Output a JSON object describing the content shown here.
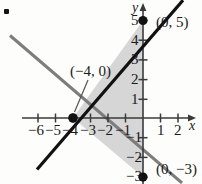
{
  "figure": {
    "kind": "coordinate-plane-graph",
    "background_color": "#fdfdfc",
    "bullet_marker": {
      "present": true,
      "x": 5,
      "y": 9
    }
  },
  "axes": {
    "x_axis_label": "x",
    "y_axis_label": "y",
    "origin_px": {
      "x": 143,
      "y": 118
    },
    "unit_px": {
      "x": 17.5,
      "y": 19.7
    },
    "x_range": [
      -7.6,
      3.2
    ],
    "y_range": [
      -3.4,
      5.9
    ],
    "x_tick_labels": [
      "−6",
      "−5",
      "−4",
      "−3",
      "−2",
      "−1",
      "1",
      "2"
    ],
    "x_tick_values": [
      -6,
      -5,
      -4,
      -3,
      -2,
      -1,
      1,
      2
    ],
    "y_tick_labels": [
      "5",
      "4",
      "3",
      "2",
      "1",
      "−1",
      "−2",
      "−3"
    ],
    "y_tick_values": [
      5,
      4,
      3,
      2,
      1,
      -1,
      -2,
      -3
    ],
    "axis_color": "#3a3a3a",
    "tick_color": "#3a3a3a"
  },
  "region": {
    "fill_color": "#d6d6d6",
    "vertices": [
      [
        -4,
        0
      ],
      [
        0,
        5
      ],
      [
        0,
        -3
      ]
    ]
  },
  "lines": [
    {
      "name": "line-black",
      "color": "#111111",
      "width": 3.2,
      "through": [
        [
          -4,
          0
        ],
        [
          0,
          5
        ]
      ],
      "slope": 1.25,
      "y_intercept": 5,
      "x_intercept": -4
    },
    {
      "name": "line-gray",
      "color": "#7d7d7d",
      "width": 3.0,
      "through": [
        [
          -4,
          0
        ],
        [
          0,
          -3
        ]
      ],
      "slope": -0.75,
      "y_intercept": -3,
      "x_intercept": -4
    }
  ],
  "points": [
    {
      "name": "point-0-5",
      "label": "(0, 5)",
      "coords": [
        0,
        5
      ],
      "label_px": {
        "x": 156,
        "y": 16
      }
    },
    {
      "name": "point-neg4-0",
      "label": "(−4, 0)",
      "coords": [
        -4,
        0
      ],
      "label_px": {
        "x": 70,
        "y": 66
      }
    },
    {
      "name": "point-0-neg3",
      "label": "(0, −3)",
      "coords": [
        0,
        -3
      ],
      "label_px": {
        "x": 156,
        "y": 161
      }
    }
  ],
  "leader_line": {
    "name": "leader-line-neg4-0",
    "from_px": {
      "x": 88,
      "y": 80
    },
    "to_px": {
      "x": 74,
      "y": 112
    },
    "color": "#555555"
  }
}
